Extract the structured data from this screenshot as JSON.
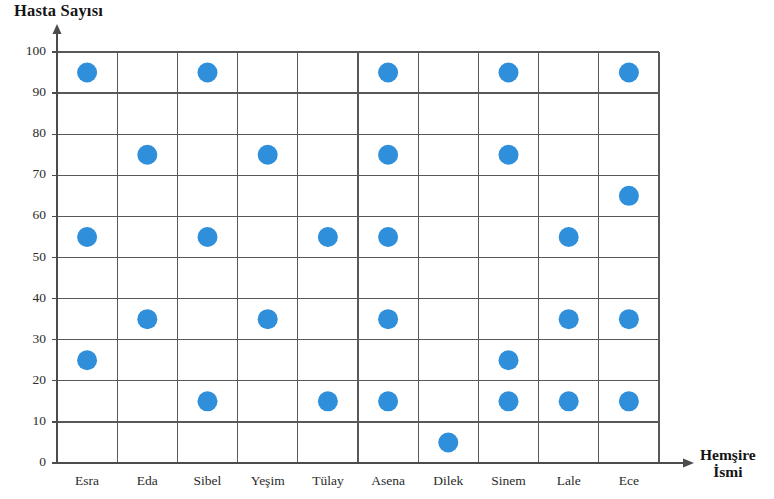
{
  "chart_data": {
    "type": "scatter",
    "title": "",
    "ylabel": "Hasta Sayısı",
    "xlabel": "Hemşire İsmi",
    "xlabel_lines": [
      "Hemşire",
      "İsmi"
    ],
    "categories": [
      "Esra",
      "Eda",
      "Sibel",
      "Yeşim",
      "Tülay",
      "Asena",
      "Dilek",
      "Sinem",
      "Lale",
      "Ece"
    ],
    "ylim": [
      0,
      100
    ],
    "yticks": [
      0,
      10,
      20,
      30,
      40,
      50,
      60,
      70,
      80,
      90,
      100
    ],
    "ytick_labels": [
      "0",
      "10",
      "20",
      "30",
      "40",
      "50",
      "60",
      "70",
      "80",
      "90",
      "100"
    ],
    "grid": true,
    "legend": "none",
    "marker_color": "#2f8fda",
    "marker_radius": 10,
    "points": [
      {
        "category": "Esra",
        "values": [
          95,
          55,
          25
        ]
      },
      {
        "category": "Eda",
        "values": [
          75,
          35
        ]
      },
      {
        "category": "Sibel",
        "values": [
          95,
          55,
          15
        ]
      },
      {
        "category": "Yeşim",
        "values": [
          75,
          35
        ]
      },
      {
        "category": "Tülay",
        "values": [
          55,
          15
        ]
      },
      {
        "category": "Asena",
        "values": [
          95,
          75,
          55,
          35,
          15
        ]
      },
      {
        "category": "Dilek",
        "values": [
          5
        ]
      },
      {
        "category": "Sinem",
        "values": [
          95,
          75,
          25,
          15
        ]
      },
      {
        "category": "Lale",
        "values": [
          55,
          35,
          15
        ]
      },
      {
        "category": "Ece",
        "values": [
          95,
          65,
          35,
          15
        ]
      }
    ]
  },
  "axes": {
    "grid_left": 57,
    "grid_right": 659,
    "grid_top": 52,
    "grid_bottom": 463,
    "x_arrow_end": 694,
    "y_arrow_top": 24,
    "axis_color": "#4c4c4c",
    "grid_color": "#585858"
  }
}
